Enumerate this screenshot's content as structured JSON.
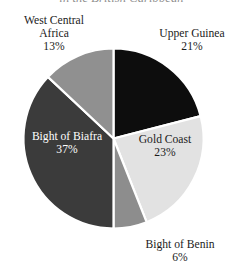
{
  "chart_title": "in the British Caribbean",
  "chart_data": {
    "type": "pie",
    "title": "in the British Caribbean",
    "subtitle": "",
    "xlabel": "",
    "ylabel": "",
    "legend_position": "none",
    "grid": false,
    "start_angle_deg": 0,
    "direction": "clockwise",
    "categories": [
      "Upper Guinea",
      "Gold Coast",
      "Bight of Benin",
      "Bight of Biafra",
      "West Central Africa"
    ],
    "values": [
      21,
      23,
      6,
      37,
      13
    ],
    "value_unit": "%",
    "slices": [
      {
        "label": "Upper Guinea",
        "value": 21,
        "value_text": "21%",
        "color": "#0d0d0d",
        "label_placement": "outside-right",
        "label_color": "#1b1b1b"
      },
      {
        "label": "Gold Coast",
        "value": 23,
        "value_text": "23%",
        "color": "#e2e2e2",
        "label_placement": "inside",
        "label_color": "#1b1b1b"
      },
      {
        "label": "Bight of Benin",
        "value": 6,
        "value_text": "6%",
        "color": "#8d8d8d",
        "label_placement": "outside-bottom",
        "label_color": "#1b1b1b"
      },
      {
        "label": "Bight of Biafra",
        "value": 37,
        "value_text": "37%",
        "color": "#3b3b3b",
        "label_placement": "inside",
        "label_color": "#ffffff"
      },
      {
        "label": "West Central Africa",
        "value": 13,
        "value_text": "13%",
        "color": "#909090",
        "label_placement": "outside-left",
        "label_color": "#1b1b1b"
      }
    ],
    "separator_color": "#ffffff",
    "background_color": "#ffffff"
  },
  "labels": {
    "west_central_africa": {
      "name_line1": "West Central",
      "name_line2": "Africa",
      "pct": "13%"
    },
    "upper_guinea": {
      "name": "Upper Guinea",
      "pct": "21%"
    },
    "gold_coast": {
      "name": "Gold Coast",
      "pct": "23%"
    },
    "bight_of_biafra": {
      "name": "Bight of Biafra",
      "pct": "37%"
    },
    "bight_of_benin": {
      "name": "Bight of Benin",
      "pct": "6%"
    }
  }
}
